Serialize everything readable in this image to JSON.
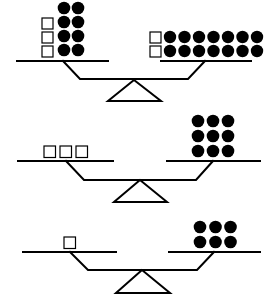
{
  "figure": {
    "colors": {
      "ink": "#000000",
      "background": "#ffffff"
    },
    "balances": [
      {
        "id": "balance-1",
        "left_pan": {
          "squares": 3,
          "dots": 8,
          "dot_layout": "2 columns x 4 rows",
          "square_layout": "1 column x 3 rows"
        },
        "right_pan": {
          "squares": 2,
          "dots": 14,
          "dot_layout": "7 columns x 2 rows",
          "square_layout": "1 column x 2 rows"
        }
      },
      {
        "id": "balance-2",
        "left_pan": {
          "squares": 3,
          "dots": 0,
          "square_layout": "3 in a row"
        },
        "right_pan": {
          "squares": 0,
          "dots": 9,
          "dot_layout": "3 columns x 3 rows"
        }
      },
      {
        "id": "balance-3",
        "left_pan": {
          "squares": 1,
          "dots": 0,
          "square_layout": "single"
        },
        "right_pan": {
          "squares": 0,
          "dots": 6,
          "dot_layout": "3 columns x 2 rows"
        }
      }
    ]
  }
}
